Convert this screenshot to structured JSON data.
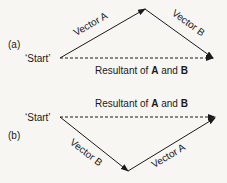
{
  "diagram_a": {
    "label": "(a)",
    "start_label": "‘Start’",
    "vector_a_label": "Vector A",
    "vector_b_label": "Vector B",
    "resultant_label_prefix": "Resultant of ",
    "resultant_a": "A",
    "resultant_and": " and ",
    "resultant_b": "B"
  },
  "diagram_b": {
    "label": "(b)",
    "start_label": "‘Start’",
    "vector_a_label": "Vector A",
    "vector_b_label": "Vector B",
    "resultant_label_prefix": "Resultant of ",
    "resultant_a": "A",
    "resultant_and": " and ",
    "resultant_b": "B"
  },
  "colors": {
    "line": "#1a1a1a",
    "background": "#f7f6f3"
  }
}
